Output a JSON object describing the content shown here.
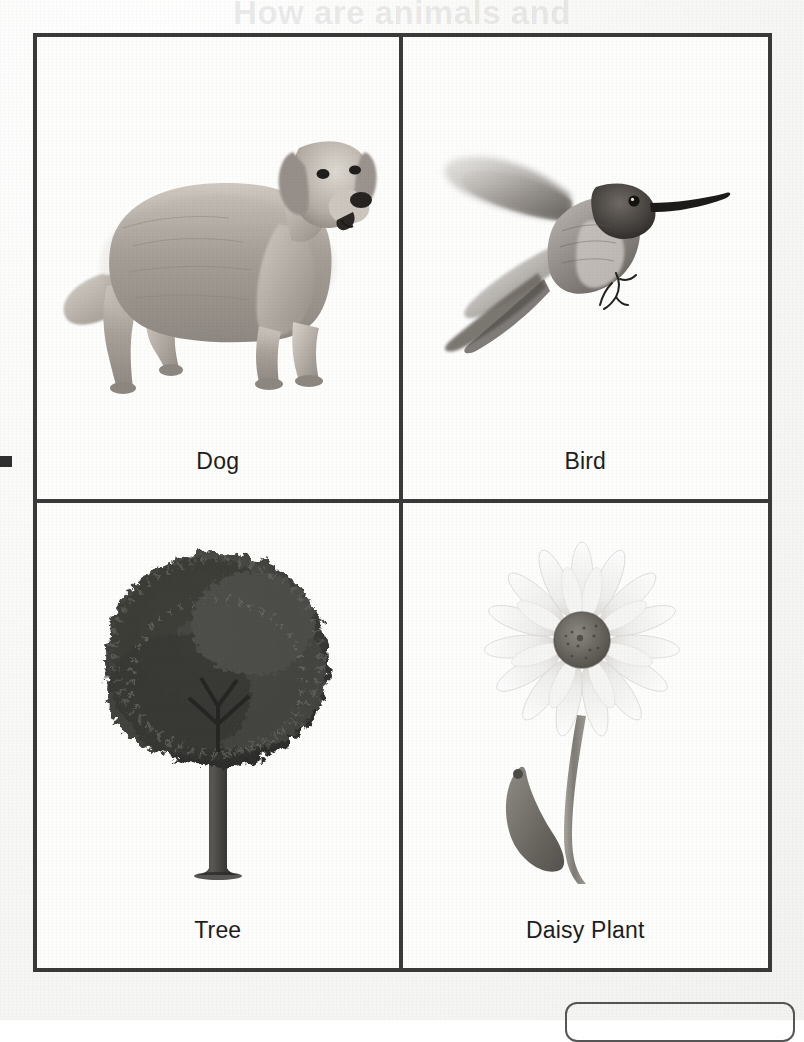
{
  "document": {
    "type": "scanned-worksheet-page",
    "bleed_through_heading": "How are animals and",
    "bleed_through_subheading": "plants alike?",
    "page_background": "#fbfbfa",
    "ink_color": "#3a3a3a"
  },
  "table": {
    "rows": 2,
    "columns": 2,
    "border_color": "#3a3a3a",
    "cells": [
      {
        "id": "cell-dog",
        "label": "Dog",
        "image": "photo-dog-golden-retriever"
      },
      {
        "id": "cell-bird",
        "label": "Bird",
        "image": "photo-hummingbird-in-flight"
      },
      {
        "id": "cell-tree",
        "label": "Tree",
        "image": "photo-deciduous-tree"
      },
      {
        "id": "cell-daisy",
        "label": "Daisy Plant",
        "image": "photo-white-daisy-flower"
      }
    ]
  },
  "artifacts": {
    "left_edge_mark": "scan-edge-mark",
    "bottom_rounded_box": "answer-box-partial"
  }
}
